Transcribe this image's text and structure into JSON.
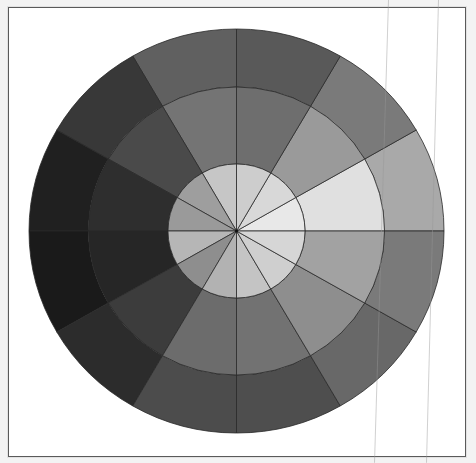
{
  "figure": {
    "type": "segmented-gray-wheel",
    "rings": [
      "outer",
      "middle",
      "inner"
    ],
    "sector_count": 12,
    "sector_angle_deg": 30,
    "center": {
      "x": 236.5,
      "y": 231
    },
    "radii": {
      "outer": {
        "rx": 207.5,
        "ry": 202
      },
      "middle": {
        "rx": 148,
        "ry": 144
      },
      "inner": {
        "rx": 68.5,
        "ry": 67
      }
    },
    "stroke_color": "#2a2a2a",
    "frame_border_color": "#5a5a5a",
    "background_color": "#ffffff"
  },
  "sectors": [
    {
      "start": 0,
      "end": 30,
      "outer": "#a9a9a9",
      "middle": "#e0e0e0",
      "inner": "#e8e8e8"
    },
    {
      "start": 30,
      "end": 60,
      "outer": "#7a7a7a",
      "middle": "#9a9a9a",
      "inner": "#d8d8d8"
    },
    {
      "start": 60,
      "end": 90,
      "outer": "#595959",
      "middle": "#6e6e6e",
      "inner": "#cdcdcd"
    },
    {
      "start": 90,
      "end": 120,
      "outer": "#606060",
      "middle": "#747474",
      "inner": "#c6c6c6"
    },
    {
      "start": 120,
      "end": 150,
      "outer": "#383838",
      "middle": "#4a4a4a",
      "inner": "#9e9e9e"
    },
    {
      "start": 150,
      "end": 180,
      "outer": "#202020",
      "middle": "#2e2e2e",
      "inner": "#9a9a9a"
    },
    {
      "start": 180,
      "end": 210,
      "outer": "#1a1a1a",
      "middle": "#262626",
      "inner": "#b6b6b6"
    },
    {
      "start": 210,
      "end": 240,
      "outer": "#2c2c2c",
      "middle": "#3c3c3c",
      "inner": "#8e8e8e"
    },
    {
      "start": 240,
      "end": 270,
      "outer": "#4c4c4c",
      "middle": "#6c6c6c",
      "inner": "#b2b2b2"
    },
    {
      "start": 270,
      "end": 300,
      "outer": "#4e4e4e",
      "middle": "#727272",
      "inner": "#c4c4c4"
    },
    {
      "start": 300,
      "end": 330,
      "outer": "#686868",
      "middle": "#8e8e8e",
      "inner": "#cfcfcf"
    },
    {
      "start": 330,
      "end": 360,
      "outer": "#7a7a7a",
      "middle": "#a2a2a2",
      "inner": "#d6d6d6"
    }
  ],
  "artifacts": [
    {
      "x_top": 388,
      "x_bottom": 374
    },
    {
      "x_top": 438,
      "x_bottom": 426
    }
  ]
}
